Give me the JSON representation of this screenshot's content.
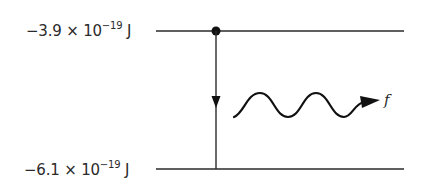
{
  "diagram": {
    "type": "energy-level-transition",
    "levels": [
      {
        "id": "upper",
        "mantissa": "−3.9",
        "times": "×",
        "base": "10",
        "exponent": "−19",
        "unit": "J"
      },
      {
        "id": "lower",
        "mantissa": "−6.1",
        "times": "×",
        "base": "10",
        "exponent": "−19",
        "unit": "J"
      }
    ],
    "transition": {
      "from": "upper",
      "to": "lower",
      "direction": "down"
    },
    "photon": {
      "label": "f",
      "icon": "wavy-arrow-icon"
    },
    "colors": {
      "line": "#2a2a2a",
      "background": "#ffffff"
    }
  }
}
